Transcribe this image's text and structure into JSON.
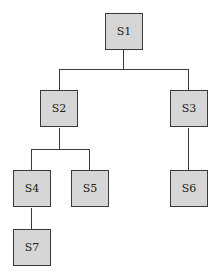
{
  "diagram": {
    "type": "tree",
    "node_color": "#d6d6d6",
    "line_color": "#3a3a3a",
    "nodes": [
      {
        "id": "S1",
        "label": "S1",
        "parent": null
      },
      {
        "id": "S2",
        "label": "S2",
        "parent": "S1"
      },
      {
        "id": "S3",
        "label": "S3",
        "parent": "S1"
      },
      {
        "id": "S4",
        "label": "S4",
        "parent": "S2"
      },
      {
        "id": "S5",
        "label": "S5",
        "parent": "S2"
      },
      {
        "id": "S6",
        "label": "S6",
        "parent": "S3"
      },
      {
        "id": "S7",
        "label": "S7",
        "parent": "S4"
      }
    ]
  }
}
